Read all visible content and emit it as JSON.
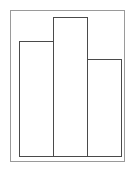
{
  "chart_data": {
    "type": "bar",
    "title": "",
    "xlabel": "",
    "ylabel": "",
    "categories": [
      "",
      "",
      ""
    ],
    "values": [
      115,
      139,
      97
    ],
    "ylim": [
      0,
      146
    ],
    "grid": false,
    "legend": null,
    "colors": {
      "frame": "#9a9a9a",
      "bar_stroke": "#4a4a4a",
      "bar_fill": "#ffffff"
    }
  }
}
